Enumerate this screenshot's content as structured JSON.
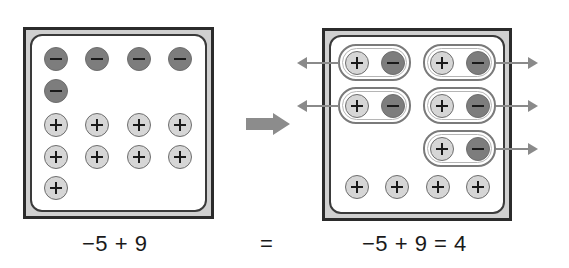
{
  "diagram": {
    "before": {
      "negative_counters": 5,
      "positive_counters": 9,
      "expression": "−5 + 9"
    },
    "transform_arrow": "right-arrow",
    "equals_sign": "=",
    "after": {
      "zero_pairs": 5,
      "remaining_positive_counters": 4,
      "expression": "−5 + 9 = 4"
    },
    "counter_symbols": {
      "positive": "+",
      "negative": "−"
    },
    "colors": {
      "negative_fill": "#7d7d7d",
      "positive_fill": "#d6d6d6",
      "frame": "#2b2b2b",
      "frame_fill": "#d0d0d0",
      "arrow": "#8a8a8a"
    }
  }
}
